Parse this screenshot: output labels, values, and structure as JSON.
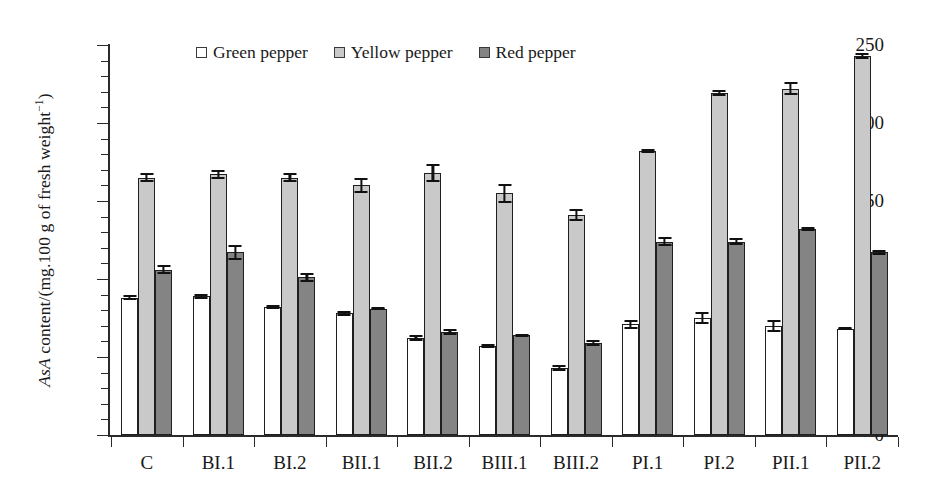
{
  "chart_data": {
    "type": "bar",
    "title": "",
    "subtitle": "",
    "xlabel": "",
    "ylabel": "AsA content/(mg.100 g of fresh weight⁻¹)",
    "ylabel_parts": {
      "italic": "AsA",
      "rest": " content/(mg.100 g of fresh weight",
      "sup": "−1",
      "close": ")"
    },
    "ylim": [
      0,
      250
    ],
    "ytick_major": [
      0,
      50,
      100,
      150,
      200,
      250
    ],
    "ytick_minor_step": 10,
    "grid": false,
    "legend_position": "top-center",
    "categories": [
      "C",
      "BI.1",
      "BI.2",
      "BII.1",
      "BII.2",
      "BIII.1",
      "BIII.2",
      "PI.1",
      "PI.2",
      "PII.1",
      "PII.2"
    ],
    "series": [
      {
        "name": "Green pepper",
        "color": "#ffffff",
        "values": [
          88,
          89,
          82,
          78,
          62,
          57,
          43,
          71,
          75,
          70,
          68
        ],
        "errors": [
          1.5,
          1.5,
          1.5,
          1.5,
          2.0,
          1.5,
          2.0,
          3.0,
          4.0,
          4.0,
          1.0
        ]
      },
      {
        "name": "Yellow pepper",
        "color": "#c9c9c9",
        "values": [
          165,
          167,
          165,
          160,
          168,
          155,
          141,
          182,
          219,
          222,
          243
        ],
        "errors": [
          3.0,
          3.0,
          3.0,
          5.0,
          6.0,
          6.0,
          4.0,
          1.5,
          2.0,
          4.0,
          2.0
        ]
      },
      {
        "name": "Red pepper",
        "color": "#848484",
        "values": [
          106,
          117,
          101,
          81,
          66,
          64,
          59,
          124,
          124,
          132,
          117
        ],
        "errors": [
          3.0,
          5.0,
          3.0,
          1.0,
          2.0,
          1.0,
          2.0,
          3.0,
          2.0,
          1.5,
          1.5
        ]
      }
    ]
  },
  "legend": {
    "entries": [
      {
        "label": "Green pepper",
        "swatch": "#ffffff"
      },
      {
        "label": "Yellow pepper",
        "swatch": "#c9c9c9"
      },
      {
        "label": "Red pepper",
        "swatch": "#848484"
      }
    ]
  }
}
